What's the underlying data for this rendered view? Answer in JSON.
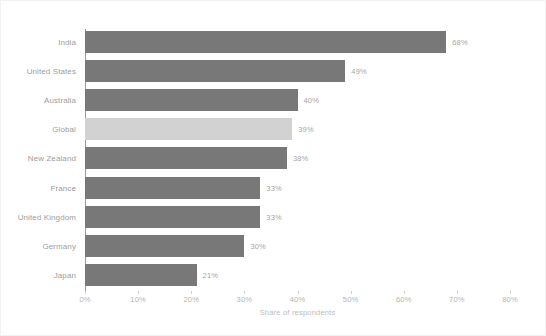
{
  "chart_data": {
    "type": "bar",
    "orientation": "horizontal",
    "title": "",
    "subtitle": "",
    "xlabel": "Share of respondents",
    "ylabel": "",
    "xlim": [
      0,
      80
    ],
    "xticks": [
      "0%",
      "10%",
      "20%",
      "30%",
      "40%",
      "50%",
      "60%",
      "70%",
      "80%"
    ],
    "xtick_values": [
      0,
      10,
      20,
      30,
      40,
      50,
      60,
      70,
      80
    ],
    "grid": false,
    "legend": "none",
    "categories": [
      "India",
      "United States",
      "Australia",
      "Global",
      "New Zealand",
      "France",
      "United Kingdom",
      "Germany",
      "Japan"
    ],
    "values": [
      68,
      49,
      40,
      39,
      38,
      33,
      33,
      30,
      21
    ],
    "data_labels": [
      "68%",
      "49%",
      "40%",
      "39%",
      "38%",
      "33%",
      "33%",
      "30%",
      "21%"
    ],
    "highlight_category": "Global",
    "colors": {
      "bar": "#787878",
      "bar_highlight": "#d2d2d2",
      "label": "#9d9d9d",
      "value_label": "#a6a6a6",
      "tick": "#b4b4b4",
      "axis": "#9a9a9a",
      "background": "#ffffff",
      "border": "#f2f2f2"
    }
  }
}
